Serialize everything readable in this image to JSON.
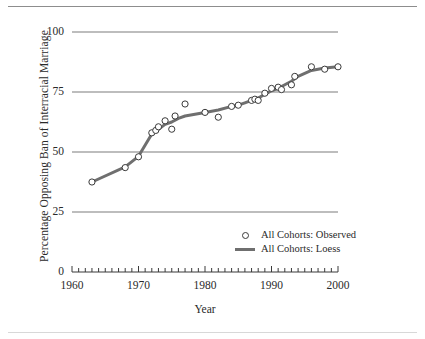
{
  "figure": {
    "running_head": "",
    "xlabel": "Year",
    "ylabel": "Percentage Opposing Ban of Interracial Marriage"
  },
  "legend": {
    "items": [
      {
        "label": "All Cohorts: Observed",
        "key": "open-circle-marker",
        "color": "#3a3a3a"
      },
      {
        "label": "All Cohorts: Loess",
        "key": "line-swatch",
        "color": "#6f6f6f"
      }
    ]
  },
  "axes": {
    "y_ticks": [
      "0",
      "25",
      "50",
      "75",
      "100"
    ],
    "x_ticks": [
      "1960",
      "1970",
      "1980",
      "1990",
      "2000"
    ]
  },
  "chart_data": {
    "type": "scatter",
    "title": "",
    "xlabel": "Year",
    "ylabel": "Percentage Opposing Ban of Interracial Marriage",
    "xlim": [
      1960,
      2000
    ],
    "ylim": [
      0,
      100
    ],
    "yticks": [
      0,
      25,
      50,
      75,
      100
    ],
    "xticks": [
      1960,
      1970,
      1980,
      1990,
      2000
    ],
    "x_minor_tick_interval": 1,
    "grid": "horizontal-gridlines-at-25-50-75-100",
    "legend_position": "lower-right-inside",
    "series": [
      {
        "name": "All Cohorts: Observed",
        "marker": "open-circle",
        "color": "#3a3a3a",
        "points": [
          [
            1963,
            37.5
          ],
          [
            1968,
            43.5
          ],
          [
            1970,
            48.0
          ],
          [
            1972,
            58.0
          ],
          [
            1972.6,
            59.0
          ],
          [
            1973,
            60.5
          ],
          [
            1974,
            63.0
          ],
          [
            1975,
            59.5
          ],
          [
            1975.5,
            65.0
          ],
          [
            1977,
            70.0
          ],
          [
            1980,
            66.5
          ],
          [
            1982,
            64.5
          ],
          [
            1984,
            69.0
          ],
          [
            1985,
            69.5
          ],
          [
            1987,
            71.5
          ],
          [
            1987.5,
            72.0
          ],
          [
            1988,
            71.5
          ],
          [
            1989,
            74.5
          ],
          [
            1990,
            76.5
          ],
          [
            1991,
            77.0
          ],
          [
            1991.5,
            76.0
          ],
          [
            1993,
            78.0
          ],
          [
            1993.5,
            81.5
          ],
          [
            1996,
            85.5
          ],
          [
            1998,
            84.5
          ],
          [
            2000,
            85.5
          ]
        ]
      },
      {
        "name": "All Cohorts: Loess",
        "marker": "line",
        "color": "#6f6f6f",
        "points": [
          [
            1963,
            37.5
          ],
          [
            1968,
            43.8
          ],
          [
            1970,
            48.2
          ],
          [
            1972,
            57.5
          ],
          [
            1973,
            59.5
          ],
          [
            1974,
            61.5
          ],
          [
            1975,
            62.5
          ],
          [
            1976,
            64.0
          ],
          [
            1977,
            65.0
          ],
          [
            1980,
            66.5
          ],
          [
            1982,
            67.5
          ],
          [
            1984,
            69.0
          ],
          [
            1985,
            69.5
          ],
          [
            1986,
            70.5
          ],
          [
            1987,
            71.5
          ],
          [
            1988,
            72.5
          ],
          [
            1989,
            74.0
          ],
          [
            1990,
            75.5
          ],
          [
            1991,
            76.5
          ],
          [
            1992,
            78.0
          ],
          [
            1993,
            79.5
          ],
          [
            1994,
            81.5
          ],
          [
            1996,
            84.0
          ],
          [
            1998,
            85.0
          ],
          [
            2000,
            85.5
          ]
        ]
      }
    ]
  }
}
